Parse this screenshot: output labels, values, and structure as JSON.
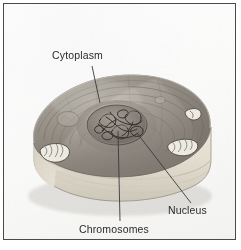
{
  "figure": {
    "frame_border_color": "#4a4a4a",
    "background_color": "#ffffff",
    "label_text_color": "#2b2b2b",
    "leader_line_color": "#3a3a3a",
    "cell_palette": {
      "cytoplasm_mid": "#9a948c",
      "cytoplasm_dark": "#6f6a63",
      "cytoplasm_light": "#c3bfb7",
      "cut_face": "#e8e3d8",
      "cut_face_shadow": "#cdc7ba",
      "nucleus_fill": "#8e8880",
      "nucleus_rim": "#5d584f",
      "chromosome_ink": "#3d3a35",
      "organelle_fill": "#efece4",
      "organelle_outline": "#55514a"
    }
  },
  "labels": {
    "cytoplasm": "Cytoplasm",
    "chromosomes": "Chromosomes",
    "nucleus": "Nucleus"
  },
  "leaders": [
    {
      "name": "cytoplasm-leader",
      "from": [
        92,
        66
      ],
      "to": [
        100,
        103
      ]
    },
    {
      "name": "chromosomes-leader",
      "from": [
        118,
        131
      ],
      "to": [
        120,
        221
      ]
    },
    {
      "name": "nucleus-leader",
      "from": [
        137,
        133
      ],
      "to": [
        191,
        203
      ]
    }
  ]
}
